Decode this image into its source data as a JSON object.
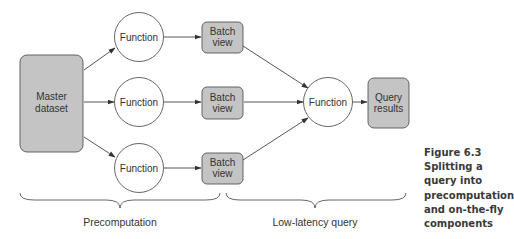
{
  "diagram": {
    "nodes": {
      "master": {
        "line1": "Master",
        "line2": "dataset"
      },
      "function_top": {
        "label": "Function"
      },
      "function_mid": {
        "label": "Function"
      },
      "function_bot": {
        "label": "Function"
      },
      "batch_top": {
        "line1": "Batch",
        "line2": "view"
      },
      "batch_mid": {
        "line1": "Batch",
        "line2": "view"
      },
      "batch_bot": {
        "line1": "Batch",
        "line2": "view"
      },
      "function_merge": {
        "label": "Function"
      },
      "query_results": {
        "line1": "Query",
        "line2": "results"
      }
    },
    "braces": {
      "precomputation": "Precomputation",
      "low_latency": "Low-latency query"
    },
    "colors": {
      "box_fill": "#c4c4c4",
      "stroke": "#555555",
      "circle_fill": "#ffffff",
      "text": "#333333"
    }
  },
  "caption": {
    "lines": [
      "Figure 6.3",
      "Splitting a",
      "query into",
      "precomputation",
      "and on-the-fly",
      "components"
    ]
  }
}
